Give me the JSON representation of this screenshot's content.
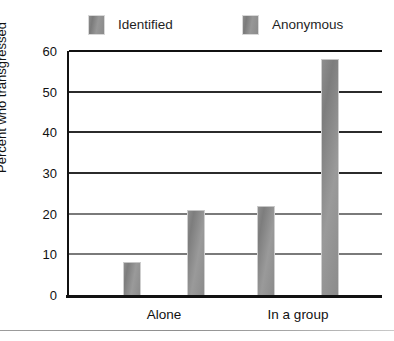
{
  "figure": {
    "cut_off_text_above": "people who transgressed",
    "bottom_rule": "divider"
  },
  "legend": {
    "position": "top",
    "items": [
      {
        "label": "Identified",
        "swatch": "gray-swatch-icon",
        "color": "#8b8b8b"
      },
      {
        "label": "Anonymous",
        "swatch": "gray-swatch-icon",
        "color": "#8b8b8b"
      }
    ]
  },
  "axes": {
    "ylabel": "Percent who transgressed",
    "yticks": [
      "0",
      "10",
      "20",
      "30",
      "40",
      "50",
      "60"
    ],
    "xcategories": [
      "Alone",
      "In a group"
    ]
  },
  "chart_data": {
    "type": "bar",
    "title": "",
    "xlabel": "",
    "ylabel": "Percent who transgressed",
    "categories": [
      "Alone",
      "In a group"
    ],
    "series": [
      {
        "name": "Identified",
        "values": [
          8,
          22
        ]
      },
      {
        "name": "Anonymous",
        "values": [
          21,
          58
        ]
      }
    ],
    "ylim": [
      0,
      60
    ],
    "ytick_values": [
      0,
      10,
      20,
      30,
      40,
      50,
      60
    ],
    "grid": "horizontal",
    "legend_position": "top",
    "bar_color": "#8b8b8b"
  }
}
